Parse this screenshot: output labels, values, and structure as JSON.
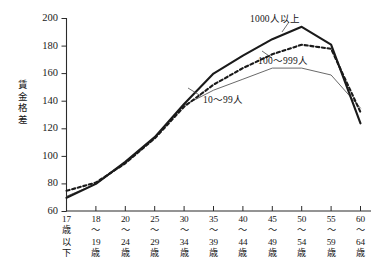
{
  "chart_data": {
    "type": "line",
    "title": "",
    "xlabel": "",
    "ylabel": "賃金格差",
    "ylim": [
      60,
      200
    ],
    "yticks": [
      60,
      80,
      100,
      120,
      140,
      160,
      180,
      200
    ],
    "grid": false,
    "legend_position": "inline-annotations",
    "categories": [
      "17歳以下",
      "18〜19歳",
      "20〜24歳",
      "25〜29歳",
      "30〜34歳",
      "35〜39歳",
      "40〜44歳",
      "45〜49歳",
      "50〜54歳",
      "55〜59歳",
      "60〜64歳"
    ],
    "series": [
      {
        "name": "1000人以上",
        "style": "solid-bold",
        "values": [
          70,
          80,
          96,
          114,
          138,
          160,
          173,
          185,
          194,
          181,
          124
        ]
      },
      {
        "name": "100〜999人",
        "style": "dotted",
        "values": [
          75,
          81,
          95,
          113,
          136,
          152,
          164,
          174,
          181,
          178,
          132
        ]
      },
      {
        "name": "10〜99人",
        "style": "solid-thin",
        "values": [
          71,
          80,
          95,
          113,
          137,
          148,
          156,
          164,
          164,
          159,
          135
        ]
      }
    ]
  },
  "yaxis": {
    "title_chars": [
      "賃",
      "金",
      "格",
      "差"
    ],
    "tick_labels": [
      "200",
      "180",
      "160",
      "140",
      "120",
      "100",
      "80",
      "60"
    ]
  },
  "xaxis": {
    "labels": [
      {
        "num": "17",
        "l2": "歳",
        "l3": "以",
        "l4": "下"
      },
      {
        "num": "18",
        "l2": "〜",
        "l3": "19",
        "l4": "歳"
      },
      {
        "num": "20",
        "l2": "〜",
        "l3": "24",
        "l4": "歳"
      },
      {
        "num": "25",
        "l2": "〜",
        "l3": "29",
        "l4": "歳"
      },
      {
        "num": "30",
        "l2": "〜",
        "l3": "34",
        "l4": "歳"
      },
      {
        "num": "35",
        "l2": "〜",
        "l3": "39",
        "l4": "歳"
      },
      {
        "num": "40",
        "l2": "〜",
        "l3": "44",
        "l4": "歳"
      },
      {
        "num": "45",
        "l2": "〜",
        "l3": "49",
        "l4": "歳"
      },
      {
        "num": "50",
        "l2": "〜",
        "l3": "54",
        "l4": "歳"
      },
      {
        "num": "55",
        "l2": "〜",
        "l3": "59",
        "l4": "歳"
      },
      {
        "num": "60",
        "l2": "〜",
        "l3": "64",
        "l4": "歳"
      }
    ]
  },
  "annotations": {
    "large": "1000人以上",
    "mid": "100〜999人",
    "small": "10〜99人"
  },
  "colors": {
    "axis": "#2b2b2b",
    "series_large": "#1a1a1a",
    "series_mid": "#1a1a1a",
    "series_small": "#585858",
    "background": "#ffffff"
  }
}
